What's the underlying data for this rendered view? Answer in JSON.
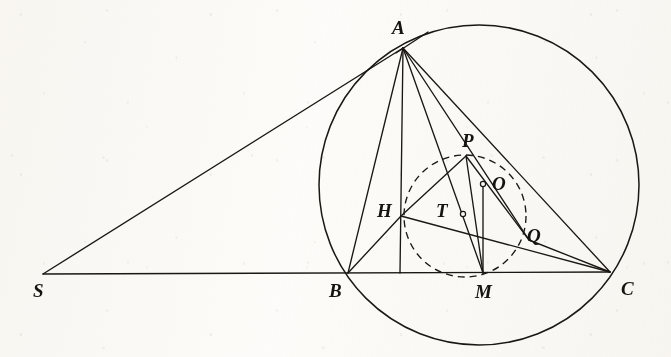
{
  "figure": {
    "kind": "euclidean-geometry-diagram",
    "ink_color": "#1a1714",
    "paper_color": "#fdfcfa",
    "stroke_width": 1.35
  },
  "points": [
    {
      "id": "A",
      "label": "A",
      "x": 403,
      "y": 48,
      "label_x": 392,
      "label_y": 18,
      "marker": "vertex"
    },
    {
      "id": "S",
      "label": "S",
      "x": 43,
      "y": 274,
      "label_x": 33,
      "label_y": 281,
      "marker": "vertex"
    },
    {
      "id": "B",
      "label": "B",
      "x": 348,
      "y": 273,
      "label_x": 329,
      "label_y": 281,
      "marker": "vertex"
    },
    {
      "id": "C",
      "label": "C",
      "x": 610,
      "y": 272,
      "label_x": 621,
      "label_y": 279,
      "marker": "vertex"
    },
    {
      "id": "M",
      "label": "M",
      "x": 483,
      "y": 273,
      "label_x": 475,
      "label_y": 282,
      "marker": "vertex"
    },
    {
      "id": "H",
      "label": "H",
      "x": 401,
      "y": 216,
      "label_x": 377,
      "label_y": 201,
      "marker": "vertex"
    },
    {
      "id": "P",
      "label": "P",
      "x": 466,
      "y": 156,
      "label_x": 462,
      "label_y": 131,
      "marker": "vertex"
    },
    {
      "id": "Q",
      "label": "Q",
      "x": 529,
      "y": 240,
      "label_x": 527,
      "label_y": 226,
      "marker": "vertex"
    },
    {
      "id": "O",
      "label": "O",
      "x": 483,
      "y": 184,
      "label_x": 492,
      "label_y": 174,
      "marker": "small-circle"
    },
    {
      "id": "T",
      "label": "T",
      "x": 463,
      "y": 214,
      "label_x": 436,
      "label_y": 201,
      "marker": "small-circle"
    }
  ],
  "circles": [
    {
      "id": "circumcircle",
      "name": "circumcircle-ABC",
      "cx": 479,
      "cy": 185,
      "r": 160,
      "style": "solid"
    },
    {
      "id": "auxcircle",
      "name": "dashed-auxiliary-circle",
      "cx": 465,
      "cy": 216,
      "r": 61,
      "style": "dashed",
      "dash": "7 5"
    }
  ],
  "segments": [
    {
      "id": "SA",
      "name": "segment-S-A",
      "x1": 43,
      "y1": 274,
      "x2": 403,
      "y2": 48
    },
    {
      "id": "SC",
      "name": "segment-S-C",
      "x1": 43,
      "y1": 274,
      "x2": 610,
      "y2": 272
    },
    {
      "id": "AB",
      "name": "segment-A-B",
      "x1": 403,
      "y1": 48,
      "x2": 348,
      "y2": 273
    },
    {
      "id": "AM",
      "name": "segment-A-M",
      "x1": 403,
      "y1": 48,
      "x2": 483,
      "y2": 273
    },
    {
      "id": "AQ",
      "name": "segment-A-Q",
      "x1": 403,
      "y1": 48,
      "x2": 529,
      "y2": 240
    },
    {
      "id": "AC",
      "name": "segment-A-C",
      "x1": 403,
      "y1": 48,
      "x2": 610,
      "y2": 272
    },
    {
      "id": "AH",
      "name": "segment-A-H-extended",
      "x1": 403,
      "y1": 48,
      "x2": 400,
      "y2": 273
    },
    {
      "id": "BH",
      "name": "segment-B-H",
      "x1": 348,
      "y1": 273,
      "x2": 401,
      "y2": 216
    },
    {
      "id": "HP",
      "name": "segment-H-P",
      "x1": 401,
      "y1": 216,
      "x2": 466,
      "y2": 156
    },
    {
      "id": "HC",
      "name": "segment-H-C",
      "x1": 401,
      "y1": 216,
      "x2": 610,
      "y2": 272
    },
    {
      "id": "PM",
      "name": "segment-P-M",
      "x1": 466,
      "y1": 156,
      "x2": 483,
      "y2": 273
    },
    {
      "id": "PQ",
      "name": "segment-P-Q",
      "x1": 466,
      "y1": 156,
      "x2": 529,
      "y2": 240
    },
    {
      "id": "OM",
      "name": "segment-O-M",
      "x1": 483,
      "y1": 184,
      "x2": 483,
      "y2": 273
    },
    {
      "id": "QC",
      "name": "segment-Q-C",
      "x1": 529,
      "y1": 240,
      "x2": 610,
      "y2": 272
    },
    {
      "id": "tangentA",
      "name": "tangent-line-at-A",
      "x1": 396,
      "y1": 53,
      "x2": 428,
      "y2": 32
    }
  ]
}
